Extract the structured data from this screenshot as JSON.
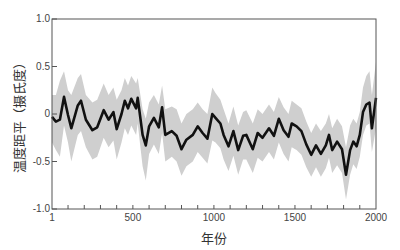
{
  "chart_data": {
    "type": "line",
    "title": "",
    "xlabel": "年份",
    "ylabel": "温度距平（摄氏度）",
    "xlim": [
      1,
      2000
    ],
    "ylim": [
      -1.0,
      1.0
    ],
    "x_ticks": [
      1,
      500,
      1000,
      1500,
      2000
    ],
    "x_minor_tick_step": 100,
    "y_ticks": [
      -1.0,
      -0.5,
      0,
      0.5,
      1.0
    ],
    "y_tick_labels": [
      "-1.0",
      "-0.5",
      "0",
      "0.5",
      "1.0"
    ],
    "grid": false,
    "legend": null,
    "colors": {
      "line": "#111111",
      "band": "#cfcfcf",
      "axis": "#555555"
    },
    "series": [
      {
        "name": "temperature_anomaly",
        "x": [
          1,
          25,
          50,
          75,
          100,
          120,
          160,
          180,
          210,
          250,
          280,
          320,
          350,
          380,
          400,
          430,
          450,
          470,
          490,
          520,
          530,
          560,
          580,
          600,
          630,
          660,
          680,
          700,
          740,
          770,
          800,
          830,
          870,
          900,
          930,
          960,
          990,
          1010,
          1040,
          1060,
          1090,
          1120,
          1150,
          1180,
          1200,
          1240,
          1270,
          1300,
          1340,
          1370,
          1400,
          1430,
          1460,
          1480,
          1510,
          1540,
          1570,
          1600,
          1630,
          1660,
          1690,
          1710,
          1730,
          1760,
          1790,
          1815,
          1840,
          1860,
          1880,
          1900,
          1920,
          1940,
          1960,
          1975,
          2000
        ],
        "values": [
          -0.03,
          -0.08,
          -0.06,
          0.18,
          -0.01,
          -0.15,
          0.09,
          0.14,
          -0.06,
          -0.17,
          -0.14,
          0.04,
          -0.06,
          0.02,
          -0.16,
          0.0,
          0.14,
          0.06,
          0.16,
          0.06,
          0.17,
          -0.22,
          -0.33,
          -0.13,
          -0.04,
          -0.14,
          0.07,
          -0.22,
          -0.18,
          -0.23,
          -0.37,
          -0.27,
          -0.22,
          -0.13,
          -0.2,
          -0.26,
          0.0,
          -0.04,
          -0.1,
          -0.22,
          -0.34,
          -0.18,
          -0.38,
          -0.23,
          -0.22,
          -0.37,
          -0.2,
          -0.25,
          -0.15,
          -0.23,
          -0.05,
          -0.17,
          -0.24,
          -0.1,
          -0.13,
          -0.18,
          -0.32,
          -0.43,
          -0.33,
          -0.42,
          -0.33,
          -0.22,
          -0.38,
          -0.29,
          -0.37,
          -0.64,
          -0.38,
          -0.29,
          -0.34,
          -0.22,
          0.02,
          0.1,
          0.12,
          -0.15,
          0.17
        ]
      },
      {
        "name": "uncertainty_band",
        "x": [
          1,
          25,
          50,
          75,
          100,
          120,
          160,
          180,
          210,
          250,
          280,
          320,
          350,
          380,
          400,
          430,
          450,
          470,
          490,
          520,
          530,
          560,
          580,
          600,
          630,
          660,
          680,
          700,
          740,
          770,
          800,
          830,
          870,
          900,
          930,
          960,
          990,
          1010,
          1040,
          1060,
          1090,
          1120,
          1150,
          1180,
          1200,
          1240,
          1270,
          1300,
          1340,
          1370,
          1400,
          1430,
          1460,
          1480,
          1510,
          1540,
          1570,
          1600,
          1630,
          1660,
          1690,
          1710,
          1730,
          1760,
          1790,
          1815,
          1840,
          1860,
          1880,
          1900,
          1920,
          1940,
          1960,
          1975,
          2000
        ],
        "upper": [
          0.2,
          0.2,
          0.35,
          0.45,
          0.25,
          0.2,
          0.38,
          0.42,
          0.2,
          0.12,
          0.15,
          0.32,
          0.2,
          0.28,
          0.15,
          0.25,
          0.38,
          0.3,
          0.4,
          0.32,
          0.38,
          0.05,
          -0.05,
          0.12,
          0.2,
          0.1,
          0.3,
          0.05,
          0.08,
          0.05,
          -0.1,
          0.0,
          0.05,
          0.12,
          0.05,
          0.0,
          0.28,
          0.22,
          0.15,
          0.05,
          -0.1,
          0.08,
          -0.12,
          0.02,
          0.04,
          -0.1,
          0.05,
          0.0,
          0.1,
          0.02,
          0.18,
          0.07,
          0.0,
          0.14,
          0.1,
          0.06,
          -0.08,
          -0.2,
          -0.1,
          -0.18,
          -0.1,
          0.0,
          -0.15,
          -0.05,
          -0.13,
          -0.35,
          -0.12,
          -0.05,
          -0.1,
          0.02,
          0.28,
          0.4,
          0.45,
          0.2,
          0.55
        ],
        "lower": [
          -0.3,
          -0.38,
          -0.45,
          -0.12,
          -0.3,
          -0.5,
          -0.22,
          -0.18,
          -0.35,
          -0.48,
          -0.45,
          -0.25,
          -0.35,
          -0.28,
          -0.48,
          -0.3,
          -0.15,
          -0.22,
          -0.12,
          -0.22,
          -0.1,
          -0.55,
          -0.7,
          -0.42,
          -0.32,
          -0.42,
          -0.2,
          -0.5,
          -0.45,
          -0.5,
          -0.65,
          -0.55,
          -0.5,
          -0.4,
          -0.46,
          -0.52,
          -0.28,
          -0.3,
          -0.36,
          -0.48,
          -0.6,
          -0.44,
          -0.64,
          -0.48,
          -0.48,
          -0.62,
          -0.46,
          -0.5,
          -0.4,
          -0.48,
          -0.3,
          -0.42,
          -0.5,
          -0.35,
          -0.38,
          -0.43,
          -0.56,
          -0.66,
          -0.56,
          -0.66,
          -0.57,
          -0.46,
          -0.62,
          -0.54,
          -0.62,
          -0.9,
          -0.64,
          -0.53,
          -0.58,
          -0.45,
          -0.22,
          -0.12,
          -0.1,
          -0.4,
          -0.15
        ]
      }
    ]
  }
}
